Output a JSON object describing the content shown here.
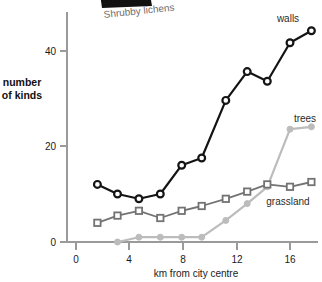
{
  "chart_data": {
    "type": "line",
    "title": "",
    "subtitle": "",
    "xlabel": "km from city centre",
    "ylabel": "number of kinds",
    "xlim": [
      0,
      18.6
    ],
    "ylim": [
      0,
      48
    ],
    "xticks": [
      0,
      4,
      8,
      12,
      16
    ],
    "yticks": [
      0,
      20,
      40
    ],
    "xtick_labels": [
      "0",
      "4",
      "8",
      "12",
      "16"
    ],
    "ytick_labels": [
      "0",
      "20",
      "40"
    ],
    "grid": false,
    "legend_position": "inline-right-of-series",
    "annotations": [
      {
        "text": "Shrubby lichens",
        "note": "partially cropped caption at top of image"
      }
    ],
    "series": [
      {
        "name": "walls",
        "label": "walls",
        "color": "#141414",
        "marker": "open-circle",
        "x": [
          1.6,
          3.1,
          4.7,
          6.3,
          7.9,
          9.4,
          11.2,
          12.8,
          14.3,
          16.0,
          17.6
        ],
        "values": [
          12,
          10,
          9,
          10,
          16,
          17.5,
          29.5,
          35.5,
          33.5,
          41.5,
          44
        ]
      },
      {
        "name": "grassland",
        "label": "grassland",
        "color": "#737373",
        "marker": "open-square",
        "x": [
          1.6,
          3.1,
          4.7,
          6.3,
          7.9,
          9.4,
          11.2,
          12.8,
          14.3,
          16.0,
          17.6
        ],
        "values": [
          4,
          5.5,
          6.5,
          5,
          6.5,
          7.5,
          9,
          10.5,
          12,
          11.5,
          12.5
        ]
      },
      {
        "name": "trees",
        "label": "trees",
        "color": "#bcbcbc",
        "marker": "filled-circle",
        "x": [
          3.1,
          4.7,
          6.3,
          7.9,
          9.4,
          11.2,
          12.8,
          14.3,
          16.0,
          17.6
        ],
        "values": [
          0,
          1,
          1,
          1,
          1,
          4.5,
          8,
          11.5,
          23.5,
          24
        ]
      }
    ]
  },
  "axis": {
    "x_title": "km from city centre",
    "y_title_line1": "number",
    "y_title_line2": "of kinds"
  },
  "labels": {
    "walls": "walls",
    "trees": "trees",
    "grassland": "grassland",
    "legend_caption": "Shrubby lichens"
  },
  "colors": {
    "walls": "#141414",
    "grassland": "#737373",
    "trees": "#bcbcbc",
    "axis": "#9a9a9a",
    "text": "#1a1a1a"
  }
}
